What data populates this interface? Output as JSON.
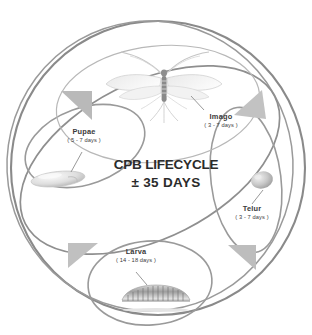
{
  "diagram": {
    "title_main": "CPB LIFECYCLE",
    "title_sub": "± 35 DAYS",
    "background_color": "#ffffff",
    "ring_color": "#8a8a8a",
    "arrow_color": "#b3b3b3",
    "text_color": "#3a3a3a",
    "title_color": "#2b2b2b"
  },
  "stages": [
    {
      "id": "imago",
      "name": "Imago",
      "duration": "( 3 - 7 days )",
      "illustration": "adult-winged-insect"
    },
    {
      "id": "telur",
      "name": "Telur",
      "duration": "( 3 - 7 days )",
      "illustration": "egg-oval"
    },
    {
      "id": "larva",
      "name": "Larva",
      "duration": "( 14 - 18 days )",
      "illustration": "segmented-caterpillar"
    },
    {
      "id": "pupae",
      "name": "Pupae",
      "duration": "( 5 - 7 days )",
      "illustration": "pupa-capsule"
    }
  ],
  "flow_arrows": [
    {
      "id": "arrow-top-left",
      "direction": "counterclockwise"
    },
    {
      "id": "arrow-top-right",
      "direction": "counterclockwise"
    },
    {
      "id": "arrow-bottom-left",
      "direction": "counterclockwise"
    },
    {
      "id": "arrow-bottom-right",
      "direction": "counterclockwise"
    }
  ]
}
